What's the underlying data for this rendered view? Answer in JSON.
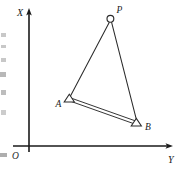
{
  "figure": {
    "kind": "survey-triangle-diagram",
    "width": 182,
    "height": 169,
    "background_color": "#ffffff",
    "ink_color": "#1a1a1a"
  },
  "axes": {
    "vertical_label": "X",
    "horizontal_label": "Y",
    "origin_label": "O",
    "origin_px": {
      "x": 29,
      "y": 146
    },
    "vertical_tip_px": {
      "x": 29,
      "y": 10
    },
    "horizontal_tip_px": {
      "x": 172,
      "y": 146
    },
    "vertical_label_px": {
      "x": 18,
      "y": 15
    },
    "horizontal_label_px": {
      "x": 169,
      "y": 162
    },
    "origin_label_px": {
      "x": 13,
      "y": 158
    },
    "arrowheads": true
  },
  "points": [
    {
      "id": "P",
      "label": "P",
      "marker": "circle",
      "marker_role": "unknown-station",
      "px": {
        "x": 110,
        "y": 19
      },
      "label_px": {
        "x": 117,
        "y": 11
      }
    },
    {
      "id": "A",
      "label": "A",
      "marker": "triangle",
      "marker_role": "known-control-station",
      "px": {
        "x": 69,
        "y": 99
      },
      "label_px": {
        "x": 56,
        "y": 106
      }
    },
    {
      "id": "B",
      "label": "B",
      "marker": "triangle",
      "marker_role": "known-control-station",
      "px": {
        "x": 136,
        "y": 123
      },
      "label_px": {
        "x": 145,
        "y": 128
      }
    }
  ],
  "edges": [
    {
      "id": "PA",
      "from": "P",
      "to": "A",
      "style": "single-line"
    },
    {
      "id": "PB",
      "from": "P",
      "to": "B",
      "style": "single-line"
    },
    {
      "id": "AB",
      "from": "A",
      "to": "B",
      "style": "double-line",
      "role": "baseline"
    }
  ],
  "margin_artifacts": [
    {
      "x": 1,
      "y": 33,
      "w": 5,
      "h": 4
    },
    {
      "x": 1,
      "y": 45,
      "w": 5,
      "h": 3
    },
    {
      "x": 1,
      "y": 58,
      "w": 5,
      "h": 4
    },
    {
      "x": 0,
      "y": 72,
      "w": 6,
      "h": 5
    },
    {
      "x": 1,
      "y": 90,
      "w": 5,
      "h": 5
    },
    {
      "x": 1,
      "y": 110,
      "w": 5,
      "h": 5
    },
    {
      "x": 0,
      "y": 153,
      "w": 7,
      "h": 4
    }
  ]
}
